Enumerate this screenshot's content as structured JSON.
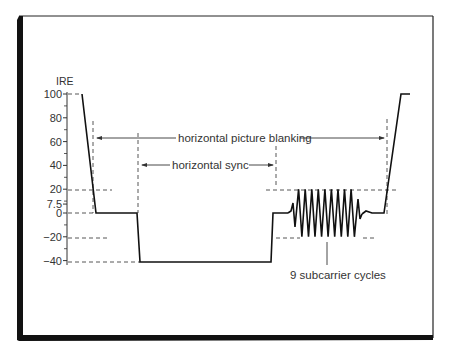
{
  "figure": {
    "frame_color": "#111111",
    "line_color": "#111111",
    "dashed_color": "#444444",
    "text_color": "#333333"
  },
  "axis": {
    "title": "IRE",
    "ticks": [
      {
        "label": "100",
        "value": 100
      },
      {
        "label": "80",
        "value": 80
      },
      {
        "label": "60",
        "value": 60
      },
      {
        "label": "40",
        "value": 40
      },
      {
        "label": "20",
        "value": 20
      },
      {
        "label": "7.5",
        "value": 7.5
      },
      {
        "label": "0",
        "value": 0
      },
      {
        "label": "−20",
        "value": -20
      },
      {
        "label": "−40",
        "value": -40
      }
    ]
  },
  "annotations": {
    "blanking": "horizontal picture blanking",
    "sync": "horizontal sync",
    "burst": "9 subcarrier cycles"
  },
  "chart_data": {
    "type": "line",
    "title": "",
    "ylabel": "IRE",
    "xlabel": "",
    "ylim": [
      -40,
      100
    ],
    "yticks": [
      100,
      80,
      60,
      40,
      20,
      7.5,
      0,
      -20,
      -40
    ],
    "grid": false,
    "waveform_segments": [
      {
        "name": "active video end",
        "level": 100
      },
      {
        "name": "front porch",
        "level": 0
      },
      {
        "name": "horizontal sync tip",
        "level": -40
      },
      {
        "name": "breezeway",
        "level": 0
      },
      {
        "name": "color burst",
        "amplitude_min": -20,
        "amplitude_max": 20,
        "cycles": 9
      },
      {
        "name": "back porch",
        "level": 0
      },
      {
        "name": "active video start",
        "level": 100
      }
    ],
    "annotations": [
      {
        "text": "horizontal picture blanking",
        "type": "span-arrow"
      },
      {
        "text": "horizontal sync",
        "type": "span-arrow"
      },
      {
        "text": "9 subcarrier cycles",
        "type": "leader-label"
      }
    ]
  }
}
